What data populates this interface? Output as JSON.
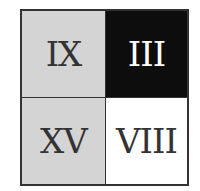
{
  "cells": [
    {
      "label": "IX",
      "bg": "#d4d4d4",
      "fg": "#333333"
    },
    {
      "label": "III",
      "bg": "#0d0d0d",
      "fg": "#ffffff"
    },
    {
      "label": "XV",
      "bg": "#d4d4d4",
      "fg": "#333333"
    },
    {
      "label": "VIII",
      "bg": "#ffffff",
      "fg": "#333333"
    }
  ]
}
